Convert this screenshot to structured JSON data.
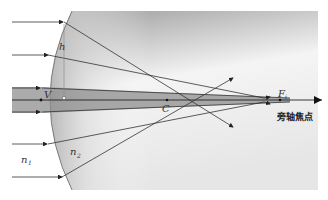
{
  "diagram": {
    "labels": {
      "height": "h",
      "vertex": "V",
      "center": "C",
      "focus": "F",
      "focus_sub": "i",
      "n1": "n",
      "n1_sub": "1",
      "n2": "n",
      "n2_sub": "2",
      "paraxial_focus": "旁轴焦点"
    },
    "colors": {
      "medium_dark": "#9a9a9a",
      "medium_light": "#f2f2f2",
      "ray": "#333333",
      "paraxial_band": "#8f8f8f"
    },
    "rays": [
      {
        "y_in": 22,
        "name": "marginal-ray-top"
      },
      {
        "y_in": 55,
        "name": "ray-upper"
      },
      {
        "y_in": 88,
        "name": "paraxial-ray-top"
      },
      {
        "y_in": 100,
        "name": "axis-ray"
      },
      {
        "y_in": 112,
        "name": "paraxial-ray-bottom"
      },
      {
        "y_in": 143,
        "name": "ray-lower"
      },
      {
        "y_in": 176,
        "name": "marginal-ray-bottom"
      }
    ]
  }
}
